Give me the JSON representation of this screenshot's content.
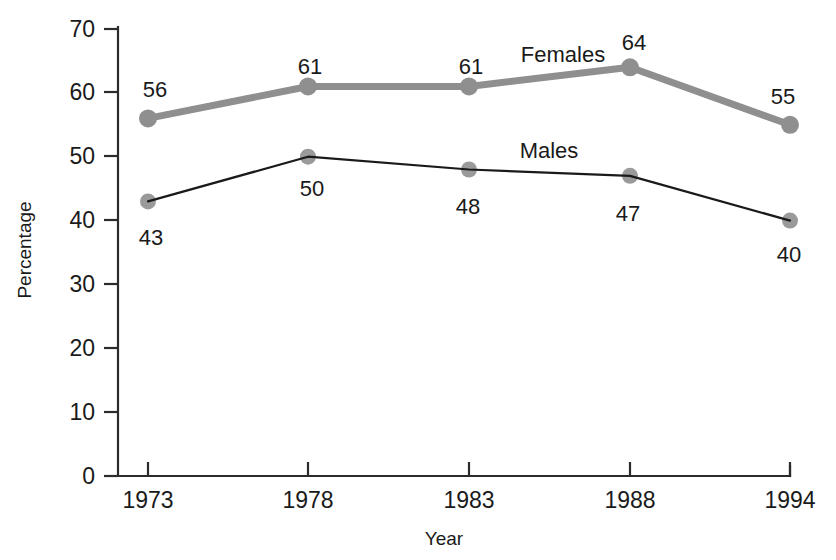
{
  "chart_data": {
    "type": "line",
    "title": "",
    "xlabel": "Year",
    "ylabel": "Percentage",
    "categories": [
      "1973",
      "1978",
      "1983",
      "1988",
      "1994"
    ],
    "ylim": [
      0,
      70
    ],
    "yticks": [
      "0",
      "10",
      "20",
      "30",
      "40",
      "50",
      "60",
      "70"
    ],
    "ytick_values": [
      0,
      10,
      20,
      30,
      40,
      50,
      60,
      70
    ],
    "grid": false,
    "legend_position": "inline-annotation",
    "series": [
      {
        "name": "Females",
        "values": [
          56,
          61,
          61,
          64,
          55
        ],
        "labels": [
          "56",
          "61",
          "61",
          "64",
          "55"
        ],
        "label_position": "above",
        "line_color": "#8f8f8f",
        "line_width": "thick",
        "marker_color": "#8f8f8f",
        "annotation": "Females"
      },
      {
        "name": "Males",
        "values": [
          43,
          50,
          48,
          47,
          40
        ],
        "labels": [
          "43",
          "50",
          "48",
          "47",
          "40"
        ],
        "label_position": "below",
        "line_color": "#1a1a1a",
        "line_width": "thin",
        "marker_color": "#9a9a9a",
        "annotation": "Males"
      }
    ]
  },
  "colors": {
    "axis": "#2b2b2b",
    "text": "#1a1a1a",
    "females_gray": "#8f8f8f",
    "males_black": "#1a1a1a",
    "marker_gray": "#9a9a9a",
    "background": "#ffffff"
  }
}
